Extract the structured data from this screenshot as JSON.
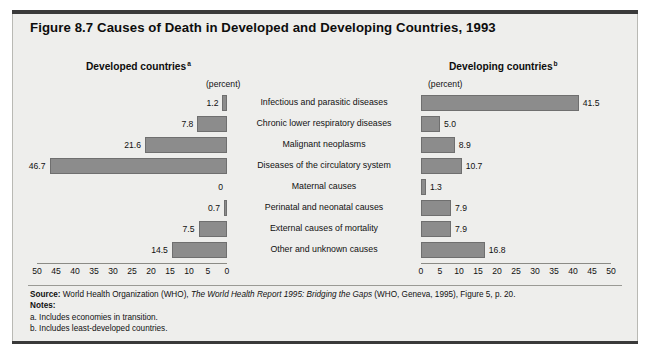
{
  "figure": {
    "title": "Figure 8.7  Causes of Death in Developed and Developing Countries, 1993"
  },
  "panels": {
    "left": {
      "heading": "Developed countries",
      "heading_superscript": "a",
      "unit": "(percent)"
    },
    "right": {
      "heading": "Developing countries",
      "heading_superscript": "b",
      "unit": "(percent)"
    }
  },
  "footer": {
    "source_label": "Source:",
    "source_pre": " World Health Organization (WHO), ",
    "source_italic": "The World Health Report 1995: Bridging the Gaps",
    "source_post": " (WHO, Geneva, 1995), Figure 5, p. 20.",
    "notes_label": "Notes:",
    "note_a": "a. Includes economies in transition.",
    "note_b": "b. Includes least-developed countries."
  },
  "chart_data": {
    "type": "bar",
    "title": "Figure 8.7  Causes of Death in Developed and Developing Countries, 1993",
    "orientation": "horizontal",
    "layout": "back-to-back bidirectional (tornado) bar chart",
    "xlabel": "(percent)",
    "ylabel": "",
    "xlim": [
      0,
      50
    ],
    "xticks_left": [
      "50",
      "45",
      "40",
      "35",
      "30",
      "25",
      "20",
      "15",
      "10",
      "5",
      "0"
    ],
    "xticks_right": [
      "0",
      "5",
      "10",
      "15",
      "20",
      "25",
      "30",
      "35",
      "40",
      "45",
      "50"
    ],
    "grid": false,
    "legend": "none",
    "bar_color": "#8c8c8c",
    "categories": [
      "Infectious and parasitic diseases",
      "Chronic lower respiratory diseases",
      "Malignant neoplasms",
      "Diseases of the circulatory system",
      "Maternal causes",
      "Perinatal and neonatal causes",
      "External causes of mortality",
      "Other and unknown causes"
    ],
    "series": [
      {
        "name": "Developed countries",
        "side": "left",
        "values": [
          1.2,
          7.8,
          21.6,
          46.7,
          0,
          0.7,
          7.5,
          14.5
        ],
        "labels": [
          "1.2",
          "7.8",
          "21.6",
          "46.7",
          "0",
          "0.7",
          "7.5",
          "14.5"
        ]
      },
      {
        "name": "Developing countries",
        "side": "right",
        "values": [
          41.5,
          5.0,
          8.9,
          10.7,
          1.3,
          7.9,
          7.9,
          16.8
        ],
        "labels": [
          "41.5",
          "5.0",
          "8.9",
          "10.7",
          "1.3",
          "7.9",
          "7.9",
          "16.8"
        ]
      }
    ]
  }
}
